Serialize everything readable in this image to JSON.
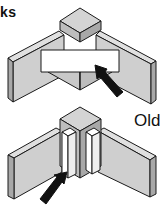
{
  "figure": {
    "title_fragment": "ks",
    "labels": {
      "old": "Old"
    },
    "panels": [
      {
        "name": "top-assembly",
        "description": "Corner joint with horizontal glue block",
        "arrow": "points to horizontal block"
      },
      {
        "name": "bottom-assembly",
        "description": "Corner joint with vertical glue blocks",
        "arrow": "points to vertical block",
        "label": "Old"
      }
    ],
    "colors": {
      "face_light": "#d9d9d9",
      "face_mid": "#c4c4c4",
      "face_dark": "#a8a8a8",
      "block_white": "#ffffff",
      "line": "#1a1a1a"
    }
  }
}
